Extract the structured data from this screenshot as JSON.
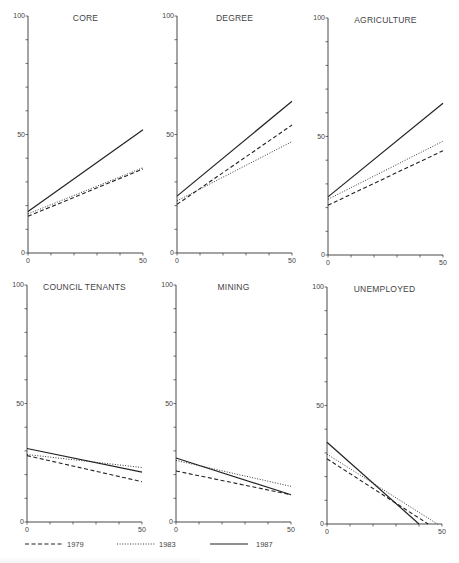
{
  "chart_data": [
    {
      "type": "line",
      "title": "CORE",
      "xlabel": "",
      "ylabel": "",
      "x": [
        0,
        50
      ],
      "xlim": [
        0,
        50
      ],
      "ylim": [
        0,
        100
      ],
      "xticks": [
        0,
        10,
        20,
        30,
        40,
        50
      ],
      "xtick_labels": [
        "0",
        "50"
      ],
      "yticks": [
        0,
        10,
        20,
        30,
        40,
        50,
        60,
        70,
        80,
        90,
        100
      ],
      "ytick_labels": [
        "0",
        "50",
        "100"
      ],
      "grid": false,
      "series": [
        {
          "name": "1979",
          "style": "dashed",
          "values": [
            15.5,
            35.5
          ]
        },
        {
          "name": "1983",
          "style": "dotted",
          "values": [
            16.5,
            36
          ]
        },
        {
          "name": "1987",
          "style": "solid",
          "values": [
            17.5,
            52
          ]
        }
      ]
    },
    {
      "type": "line",
      "title": "DEGREE",
      "xlabel": "",
      "ylabel": "",
      "x": [
        0,
        50
      ],
      "xlim": [
        0,
        50
      ],
      "ylim": [
        0,
        100
      ],
      "xticks": [
        0,
        10,
        20,
        30,
        40,
        50
      ],
      "xtick_labels": [
        "0",
        "50"
      ],
      "yticks": [
        0,
        10,
        20,
        30,
        40,
        50,
        60,
        70,
        80,
        90,
        100
      ],
      "ytick_labels": [
        "0",
        "50",
        "100"
      ],
      "grid": false,
      "series": [
        {
          "name": "1979",
          "style": "dashed",
          "values": [
            20.5,
            54
          ]
        },
        {
          "name": "1983",
          "style": "dotted",
          "values": [
            22,
            47
          ]
        },
        {
          "name": "1987",
          "style": "solid",
          "values": [
            24,
            64
          ]
        }
      ]
    },
    {
      "type": "line",
      "title": "AGRICULTURE",
      "xlabel": "",
      "ylabel": "",
      "x": [
        0,
        50
      ],
      "xlim": [
        0,
        50
      ],
      "ylim": [
        0,
        100
      ],
      "xticks": [
        0,
        10,
        20,
        30,
        40,
        50
      ],
      "xtick_labels": [
        "0",
        "50"
      ],
      "yticks": [
        0,
        10,
        20,
        30,
        40,
        50,
        60,
        70,
        80,
        90,
        100
      ],
      "ytick_labels": [
        "0",
        "50",
        "100"
      ],
      "grid": false,
      "series": [
        {
          "name": "1979",
          "style": "dashed",
          "values": [
            21,
            44
          ]
        },
        {
          "name": "1983",
          "style": "dotted",
          "values": [
            23.5,
            48
          ]
        },
        {
          "name": "1987",
          "style": "solid",
          "values": [
            24.5,
            64
          ]
        }
      ]
    },
    {
      "type": "line",
      "title": "COUNCIL TENANTS",
      "xlabel": "",
      "ylabel": "",
      "x": [
        0,
        50
      ],
      "xlim": [
        0,
        50
      ],
      "ylim": [
        0,
        100
      ],
      "xticks": [
        0,
        10,
        20,
        30,
        40,
        50
      ],
      "xtick_labels": [
        "0",
        "50"
      ],
      "yticks": [
        0,
        10,
        20,
        30,
        40,
        50,
        60,
        70,
        80,
        90,
        100
      ],
      "ytick_labels": [
        "0",
        "50",
        "100"
      ],
      "grid": false,
      "series": [
        {
          "name": "1979",
          "style": "dashed",
          "values": [
            28,
            17
          ]
        },
        {
          "name": "1983",
          "style": "dotted",
          "values": [
            28.5,
            23
          ]
        },
        {
          "name": "1987",
          "style": "solid",
          "values": [
            31,
            21
          ]
        }
      ]
    },
    {
      "type": "line",
      "title": "MINING",
      "xlabel": "",
      "ylabel": "",
      "x": [
        0,
        50
      ],
      "xlim": [
        0,
        50
      ],
      "ylim": [
        0,
        100
      ],
      "xticks": [
        0,
        10,
        20,
        30,
        40,
        50
      ],
      "xtick_labels": [
        "0",
        "50"
      ],
      "yticks": [
        0,
        10,
        20,
        30,
        40,
        50,
        60,
        70,
        80,
        90,
        100
      ],
      "ytick_labels": [
        "0",
        "50",
        "100"
      ],
      "grid": false,
      "series": [
        {
          "name": "1979",
          "style": "dashed",
          "values": [
            21.5,
            11.5
          ]
        },
        {
          "name": "1983",
          "style": "dotted",
          "values": [
            26,
            15
          ]
        },
        {
          "name": "1987",
          "style": "solid",
          "values": [
            27,
            11.5
          ]
        }
      ]
    },
    {
      "type": "line",
      "title": "UNEMPLOYED",
      "xlabel": "",
      "ylabel": "",
      "x": [
        0,
        50
      ],
      "xlim": [
        0,
        50
      ],
      "ylim": [
        0,
        100
      ],
      "xticks": [
        0,
        10,
        20,
        30,
        40,
        50
      ],
      "xtick_labels": [
        "0",
        "50"
      ],
      "yticks": [
        0,
        10,
        20,
        30,
        40,
        50,
        60,
        70,
        80,
        90,
        100
      ],
      "ytick_labels": [
        "0",
        "50",
        "100"
      ],
      "grid": false,
      "series": [
        {
          "name": "1979",
          "style": "dashed",
          "points": [
            [
              0,
              27.5
            ],
            [
              44,
              0
            ]
          ]
        },
        {
          "name": "1983",
          "style": "dotted",
          "points": [
            [
              0,
              29.5
            ],
            [
              48,
              0
            ]
          ]
        },
        {
          "name": "1987",
          "style": "solid",
          "points": [
            [
              0,
              34.5
            ],
            [
              40,
              0
            ]
          ]
        }
      ]
    }
  ],
  "legend": {
    "position": "bottom",
    "entries": [
      {
        "label": "1979",
        "style": "dashed"
      },
      {
        "label": "1983",
        "style": "dotted"
      },
      {
        "label": "1987",
        "style": "solid"
      }
    ]
  },
  "colors": {
    "line": "#222222",
    "axis": "#333333",
    "text": "#444444",
    "background": "#ffffff"
  }
}
